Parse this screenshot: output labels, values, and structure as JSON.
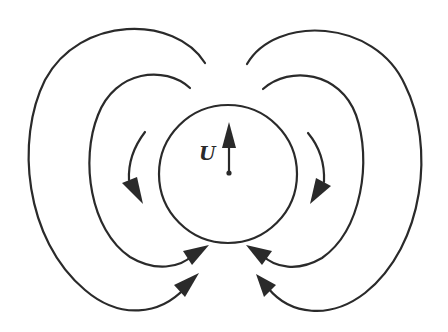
{
  "figure": {
    "velocity_label": "U",
    "colors": {
      "ink": "#2a2a2a",
      "background": "#ffffff"
    },
    "body": {
      "shape": "circle",
      "center": [
        228,
        174
      ],
      "radius": 70
    },
    "streamlines": [
      {
        "name": "left-outer",
        "side": "left",
        "arrow": "end"
      },
      {
        "name": "left-middle",
        "side": "left",
        "arrow": "end"
      },
      {
        "name": "left-inner",
        "side": "left",
        "arrow": "end"
      },
      {
        "name": "right-outer",
        "side": "right",
        "arrow": "end"
      },
      {
        "name": "right-middle",
        "side": "right",
        "arrow": "end"
      },
      {
        "name": "right-inner",
        "side": "right",
        "arrow": "end"
      }
    ]
  }
}
